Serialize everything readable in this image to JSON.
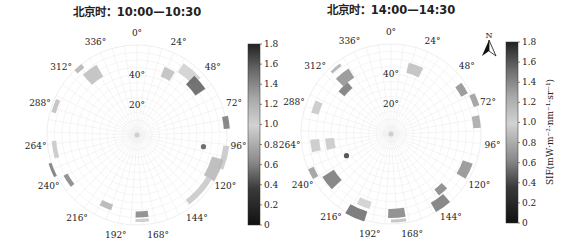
{
  "chart_data": [
    {
      "type": "polar-heatmap",
      "title": "北京时：10:00—10:30",
      "angular_axis": {
        "direction": "clockwise",
        "zero": "north",
        "tick_labels": [
          "0°",
          "24°",
          "48°",
          "72°",
          "96°",
          "120°",
          "144°",
          "168°",
          "192°",
          "216°",
          "240°",
          "264°",
          "288°",
          "312°",
          "336°"
        ],
        "tick_values": [
          0,
          24,
          48,
          72,
          96,
          120,
          144,
          168,
          192,
          216,
          240,
          264,
          288,
          312,
          336
        ]
      },
      "radial_axis": {
        "tick_labels": [
          "20°",
          "40°"
        ],
        "tick_values": [
          20,
          40
        ],
        "range": [
          0,
          60
        ]
      },
      "grid": true,
      "segments": [
        {
          "theta": [
            316,
            322
          ],
          "r": [
            57,
            60
          ],
          "value": 0.85
        },
        {
          "theta": [
            318,
            330
          ],
          "r": [
            45,
            54
          ],
          "value": 0.9
        },
        {
          "theta": [
            22,
            31
          ],
          "r": [
            42,
            49
          ],
          "value": 0.9
        },
        {
          "theta": [
            33,
            48
          ],
          "r": [
            50,
            57
          ],
          "value": 1.0
        },
        {
          "theta": [
            44,
            56
          ],
          "r": [
            47,
            55
          ],
          "value": 1.55
        },
        {
          "theta": [
            78,
            86
          ],
          "r": [
            58,
            62
          ],
          "value": 1.45
        },
        {
          "theta": [
            97,
            112
          ],
          "r": [
            58,
            62
          ],
          "value": 1.05
        },
        {
          "theta": [
            106,
            121
          ],
          "r": [
            52,
            60
          ],
          "value": 1.15
        },
        {
          "theta": [
            121,
            143
          ],
          "r": [
            54,
            58
          ],
          "value": 0.95
        },
        {
          "theta": [
            172,
            181
          ],
          "r": [
            51,
            55
          ],
          "value": 1.4
        },
        {
          "theta": [
            172,
            181
          ],
          "r": [
            56,
            58
          ],
          "value": 0.95
        },
        {
          "theta": [
            199,
            208
          ],
          "r": [
            49,
            53
          ],
          "value": 0.85
        },
        {
          "theta": [
            232,
            241
          ],
          "r": [
            53,
            56
          ],
          "value": 1.4
        },
        {
          "theta": [
            243,
            252
          ],
          "r": [
            60,
            62
          ],
          "value": 1.45
        },
        {
          "theta": [
            254,
            266
          ],
          "r": [
            54,
            57
          ],
          "value": 1.05
        },
        {
          "theta": [
            285,
            294
          ],
          "r": [
            56,
            59
          ],
          "value": 0.9
        }
      ],
      "markers": [
        {
          "theta": 100,
          "r": 45,
          "value": 1.5
        }
      ]
    },
    {
      "type": "polar-heatmap",
      "title": "北京时：14:00—14:30",
      "angular_axis": {
        "direction": "clockwise",
        "zero": "north",
        "tick_labels": [
          "0°",
          "24°",
          "48°",
          "72°",
          "96°",
          "120°",
          "144°",
          "168°",
          "192°",
          "216°",
          "240°",
          "264°",
          "288°",
          "312°",
          "336°"
        ],
        "tick_values": [
          0,
          24,
          48,
          72,
          96,
          120,
          144,
          168,
          192,
          216,
          240,
          264,
          288,
          312,
          336
        ]
      },
      "radial_axis": {
        "tick_labels": [
          "20°",
          "40°"
        ],
        "tick_values": [
          20,
          40
        ],
        "range": [
          0,
          60
        ]
      },
      "grid": true,
      "segments": [
        {
          "theta": [
            14,
            26
          ],
          "r": [
            42,
            49
          ],
          "value": 0.9
        },
        {
          "theta": [
            54,
            62
          ],
          "r": [
            53,
            58
          ],
          "value": 1.35
        },
        {
          "theta": [
            64,
            72
          ],
          "r": [
            58,
            62
          ],
          "value": 1.3
        },
        {
          "theta": [
            78,
            86
          ],
          "r": [
            55,
            60
          ],
          "value": 1.25
        },
        {
          "theta": [
            110,
            121
          ],
          "r": [
            51,
            58
          ],
          "value": 1.35
        },
        {
          "theta": [
            134,
            142
          ],
          "r": [
            47,
            52
          ],
          "value": 1.4
        },
        {
          "theta": [
            139,
            150
          ],
          "r": [
            53,
            60
          ],
          "value": 1.45
        },
        {
          "theta": [
            170,
            182
          ],
          "r": [
            50,
            56
          ],
          "value": 1.4
        },
        {
          "theta": [
            170,
            180
          ],
          "r": [
            57,
            59
          ],
          "value": 1.1
        },
        {
          "theta": [
            196,
            206
          ],
          "r": [
            47,
            52
          ],
          "value": 1.0
        },
        {
          "theta": [
            197,
            210
          ],
          "r": [
            54,
            61
          ],
          "value": 1.5
        },
        {
          "theta": [
            227,
            238
          ],
          "r": [
            45,
            54
          ],
          "value": 1.45
        },
        {
          "theta": [
            240,
            247
          ],
          "r": [
            56,
            60
          ],
          "value": 1.3
        },
        {
          "theta": [
            256,
            266
          ],
          "r": [
            38,
            44
          ],
          "value": 0.95
        },
        {
          "theta": [
            257,
            266
          ],
          "r": [
            48,
            54
          ],
          "value": 1.05
        },
        {
          "theta": [
            285,
            294
          ],
          "r": [
            50,
            55
          ],
          "value": 1.05
        },
        {
          "theta": [
            309,
            320
          ],
          "r": [
            40,
            45
          ],
          "value": 1.45
        },
        {
          "theta": [
            315,
            327
          ],
          "r": [
            45,
            52
          ],
          "value": 1.35
        },
        {
          "theta": [
            316,
            324
          ],
          "r": [
            56,
            58
          ],
          "value": 1.2
        }
      ],
      "markers": [
        {
          "theta": 244,
          "r": 33,
          "value": 1.6
        }
      ]
    }
  ],
  "colorbars": [
    {
      "ticks": [
        "1.8",
        "1.6",
        "1.4",
        "1.2",
        "1.0",
        "0.8",
        "0.6",
        "0.4",
        "0.2",
        "0"
      ],
      "range": [
        0,
        1.8
      ],
      "label": ""
    },
    {
      "ticks": [
        "1.8",
        "1.6",
        "1.4",
        "1.2",
        "1.0",
        "0.8",
        "0.6",
        "0.4",
        "0.2",
        "0"
      ],
      "range": [
        0,
        1.8
      ],
      "label": "SIF(mW·m⁻²·nm⁻¹·sr⁻¹)"
    }
  ],
  "north_arrow": {
    "label": "N"
  },
  "colors": {
    "grid": "#e6e6e6",
    "axis_text": "#222222",
    "background": "#ffffff"
  }
}
